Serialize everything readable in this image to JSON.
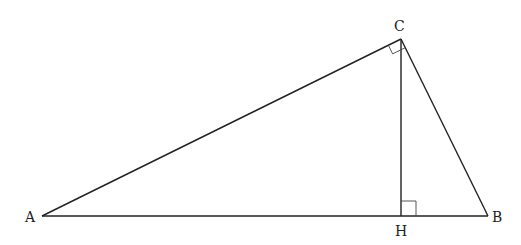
{
  "diagram": {
    "points": {
      "A": {
        "label": "A",
        "x": 42,
        "y": 216
      },
      "B": {
        "label": "B",
        "x": 488,
        "y": 216
      },
      "C": {
        "label": "C",
        "x": 401,
        "y": 39
      },
      "H": {
        "label": "H",
        "x": 401,
        "y": 216
      }
    },
    "segments": [
      "AB",
      "AC",
      "BC",
      "CH"
    ],
    "right_angles": [
      "ACB",
      "CHB"
    ],
    "stroke_color": "#222222"
  }
}
